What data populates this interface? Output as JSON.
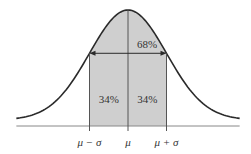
{
  "colors": {
    "curve": "#2a2a2a",
    "shade": "#cfcfcf",
    "axis": "#888888",
    "lines": "#555555"
  },
  "chart_data": {
    "type": "area",
    "distribution": "normal",
    "mean_label": "μ",
    "x_ticks": [
      {
        "value": -1,
        "label": "μ − σ"
      },
      {
        "value": 0,
        "label": "μ"
      },
      {
        "value": 1,
        "label": "μ + σ"
      }
    ],
    "x_range_sigma": [
      -2.9,
      2.9
    ],
    "shaded_region_sigma": [
      -1,
      1
    ],
    "annotations": {
      "total": "68%",
      "left_half": "34%",
      "right_half": "34%"
    }
  }
}
